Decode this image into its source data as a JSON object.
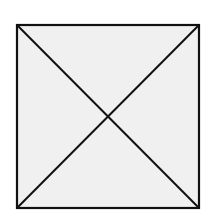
{
  "diagram": {
    "type": "square-with-diagonals",
    "square": {
      "x": 17,
      "y": 25,
      "width": 182,
      "height": 183,
      "fill": "#f0f0f0",
      "stroke": "#111111",
      "stroke_width": 2.2
    },
    "diagonals": [
      {
        "x1": 17,
        "y1": 25,
        "x2": 199,
        "y2": 208
      },
      {
        "x1": 199,
        "y1": 25,
        "x2": 17,
        "y2": 208
      }
    ],
    "line_color": "#111111",
    "line_width": 2
  }
}
